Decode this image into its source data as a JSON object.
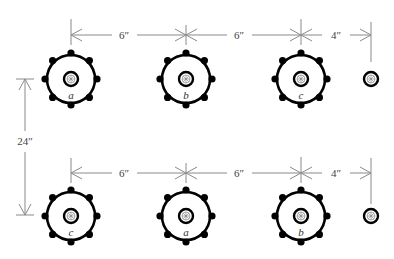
{
  "diagram": {
    "rows": [
      {
        "id": "top",
        "plants": [
          {
            "label": "a",
            "type": "large"
          },
          {
            "label": "b",
            "type": "large"
          },
          {
            "label": "c",
            "type": "large"
          },
          {
            "label": "",
            "type": "small"
          }
        ],
        "spacings": [
          "6″",
          "6″",
          "4″"
        ]
      },
      {
        "id": "bottom",
        "plants": [
          {
            "label": "c",
            "type": "large"
          },
          {
            "label": "a",
            "type": "large"
          },
          {
            "label": "b",
            "type": "large"
          },
          {
            "label": "",
            "type": "small"
          }
        ],
        "spacings": [
          "6″",
          "6″",
          "4″"
        ]
      }
    ],
    "row_spacing": "24″",
    "colors": {
      "outline": "#000000",
      "dimension": "#8a8a8a",
      "text": "#444444"
    }
  }
}
